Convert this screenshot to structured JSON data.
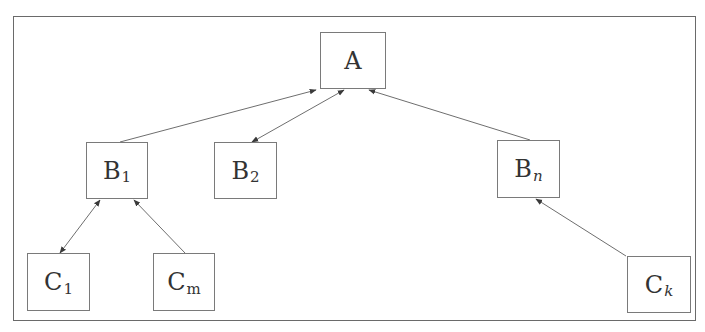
{
  "diagram": {
    "type": "hierarchy",
    "nodes": [
      {
        "id": "A",
        "label": "A",
        "sub": "",
        "sub_italic": false,
        "x": 320,
        "y": 32,
        "w": 66,
        "h": 57
      },
      {
        "id": "B1",
        "label": "B",
        "sub": "1",
        "sub_italic": false,
        "x": 86,
        "y": 142,
        "w": 62,
        "h": 57
      },
      {
        "id": "B2",
        "label": "B",
        "sub": "2",
        "sub_italic": false,
        "x": 214,
        "y": 142,
        "w": 63,
        "h": 57
      },
      {
        "id": "Bn",
        "label": "B",
        "sub": "n",
        "sub_italic": true,
        "x": 497,
        "y": 140,
        "w": 63,
        "h": 58
      },
      {
        "id": "C1",
        "label": "C",
        "sub": "1",
        "sub_italic": false,
        "x": 27,
        "y": 253,
        "w": 63,
        "h": 58
      },
      {
        "id": "Cm",
        "label": "C",
        "sub": "m",
        "sub_italic": false,
        "x": 153,
        "y": 253,
        "w": 62,
        "h": 58
      },
      {
        "id": "Ck",
        "label": "C",
        "sub": "k",
        "sub_italic": true,
        "x": 627,
        "y": 256,
        "w": 64,
        "h": 57
      }
    ],
    "edges": [
      {
        "from": "B1",
        "to": "A",
        "direction": "forward",
        "x1": 120,
        "y1": 142,
        "x2": 316,
        "y2": 90
      },
      {
        "from": "B2",
        "to": "A",
        "direction": "bidirectional",
        "x1": 252,
        "y1": 142,
        "x2": 344,
        "y2": 90
      },
      {
        "from": "Bn",
        "to": "A",
        "direction": "forward",
        "x1": 530,
        "y1": 140,
        "x2": 369,
        "y2": 90
      },
      {
        "from": "C1",
        "to": "B1",
        "direction": "bidirectional",
        "x1": 60,
        "y1": 253,
        "x2": 100,
        "y2": 200
      },
      {
        "from": "Cm",
        "to": "B1",
        "direction": "forward",
        "x1": 185,
        "y1": 253,
        "x2": 134,
        "y2": 200
      },
      {
        "from": "Ck",
        "to": "Bn",
        "direction": "forward",
        "x1": 626,
        "y1": 256,
        "x2": 536,
        "y2": 199
      }
    ],
    "colors": {
      "stroke": "#6e6e6e",
      "text": "#333333",
      "background": "#ffffff"
    }
  }
}
